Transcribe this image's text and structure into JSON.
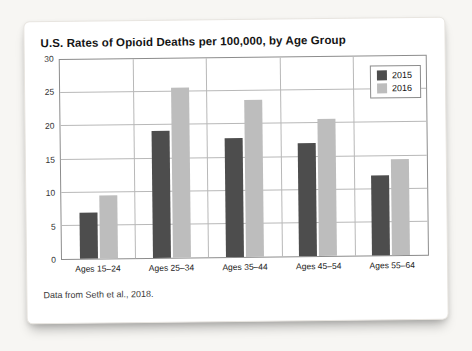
{
  "figure": {
    "title": "U.S. Rates of Opioid Deaths per 100,000, by Age Group",
    "caption": "Data from Seth et al., 2018."
  },
  "colors": {
    "series_2015": "#4d4d4d",
    "series_2016": "#bdbdbd",
    "grid": "#b8b8b8",
    "plot_border": "#8c8c8c",
    "card_background": "#ffffff",
    "page_background": "#f7f6f3"
  },
  "chart_data": {
    "type": "bar",
    "title": "U.S. Rates of Opioid Deaths per 100,000, by Age Group",
    "categories": [
      "Ages 15–24",
      "Ages 25–34",
      "Ages 35–44",
      "Ages 45–54",
      "Ages 55–64"
    ],
    "series": [
      {
        "name": "2015",
        "color": "#4d4d4d",
        "values": [
          6.9,
          19.1,
          18.0,
          17.0,
          12.1
        ]
      },
      {
        "name": "2016",
        "color": "#bdbdbd",
        "values": [
          9.5,
          25.6,
          23.7,
          20.7,
          14.4
        ]
      }
    ],
    "xlabel": "",
    "ylabel": "",
    "ylim": [
      0,
      30
    ],
    "ytick_step": 5,
    "yticks": [
      0,
      5,
      10,
      15,
      20,
      25,
      30
    ],
    "grid": true,
    "legend_position": "top-right",
    "source": "Data from Seth et al., 2018."
  }
}
